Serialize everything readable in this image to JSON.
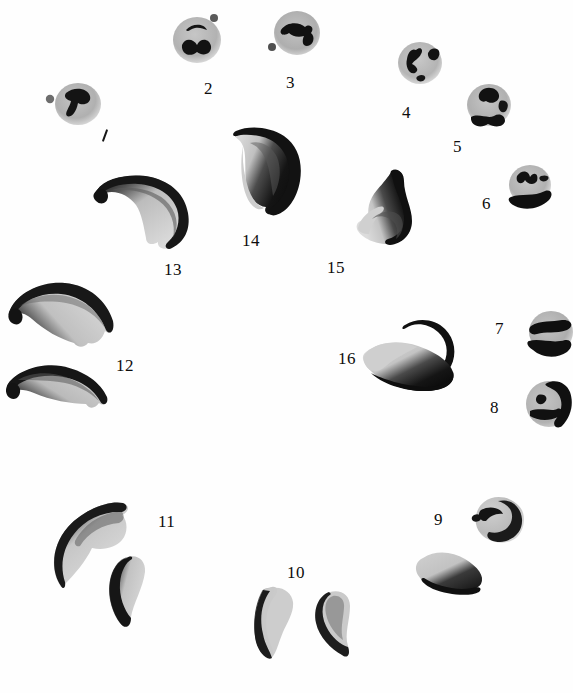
{
  "plate": {
    "kind": "microscopy-figure-plate",
    "background_color": "#fefefe",
    "ink_color": "#101010",
    "cytoplasm_color": "#b9b9b9",
    "width": 573,
    "height": 693,
    "caption": ""
  },
  "specimens": [
    {
      "id": 1,
      "label": "1",
      "label_style": "tick",
      "shape": "round-cell",
      "note": "rounded cell with dark hooked chromatin mass and small separate dot at left",
      "cx": 78,
      "cy": 104,
      "rx": 23,
      "ry": 21,
      "label_x": 99,
      "label_y": 130,
      "satellite": {
        "cx": 50,
        "cy": 99,
        "r": 4
      },
      "inclusions": [
        {
          "d": "M 66 93 C 74 86, 88 88, 90 96 C 92 104, 82 106, 78 103 C 76 114, 70 118, 67 116 C 64 113, 70 107, 71 101 C 67 100, 63 97, 66 93 Z"
        }
      ]
    },
    {
      "id": 2,
      "label": "2",
      "label_style": "numeral",
      "shape": "round-cell",
      "note": "rounded cell with crescent chromatin above and thick lobed mass below; small dot upper right",
      "cx": 197,
      "cy": 40,
      "rx": 24,
      "ry": 23,
      "label_x": 204,
      "label_y": 86,
      "satellite": {
        "cx": 213,
        "cy": 18,
        "r": 4
      },
      "inclusions": [
        {
          "d": "M 187 30 C 193 25, 203 25, 206 30 C 203 30, 200 28, 195 29 C 191 30, 189 33, 187 30 Z"
        },
        {
          "d": "M 182 44 C 186 38, 194 40, 196 45 C 199 39, 208 39, 210 46 C 211 53, 203 56, 197 52 C 191 57, 182 53, 182 44 Z"
        }
      ]
    },
    {
      "id": 3,
      "label": "3",
      "label_style": "numeral",
      "shape": "round-cell",
      "note": "rounded cell with broad angular chromatin band across upper half; dot at lower left",
      "cx": 297,
      "cy": 33,
      "rx": 23,
      "ry": 22,
      "label_x": 287,
      "label_y": 80,
      "satellite": {
        "cx": 272,
        "cy": 47,
        "r": 4
      },
      "inclusions": [
        {
          "d": "M 282 30 C 288 22, 300 23, 305 28 C 309 24, 314 28, 311 33 C 316 36, 314 45, 308 46 C 303 47, 302 40, 304 36 C 298 38, 292 36, 290 33 C 286 36, 280 35, 282 30 Z"
        }
      ]
    },
    {
      "id": 4,
      "label": "4",
      "label_style": "numeral",
      "shape": "round-cell",
      "note": "rounded cell with arrow-like chromatin left of centre and wedge at upper right",
      "cx": 420,
      "cy": 63,
      "rx": 22,
      "ry": 21,
      "label_x": 403,
      "label_y": 110,
      "inclusions": [
        {
          "d": "M 416 50 C 419 47, 423 49, 421 54 C 419 59, 414 60, 412 64 C 416 66, 419 70, 415 72 C 410 74, 406 66, 407 59 C 408 53, 412 49, 416 50 Z"
        },
        {
          "d": "M 430 50 C 436 47, 441 51, 438 57 C 435 62, 428 59, 428 54 Z"
        },
        {
          "d": "M 419 76 C 424 74, 427 78, 423 80 C 419 82, 416 78, 419 76 Z"
        }
      ]
    },
    {
      "id": 5,
      "label": "5",
      "label_style": "numeral",
      "shape": "round-cell",
      "note": "rounded cell with chromatin mass upper centre and dark band with hook along lower margin",
      "cx": 489,
      "cy": 105,
      "rx": 22,
      "ry": 21,
      "label_x": 455,
      "label_y": 144,
      "inclusions": [
        {
          "d": "M 481 92 C 487 87, 497 89, 498 95 C 499 101, 491 104, 486 101 C 481 103, 477 96, 481 92 Z"
        },
        {
          "d": "M 472 117 C 479 114, 487 119, 494 117 C 498 114, 504 115, 504 120 C 504 126, 496 127, 489 124 C 482 128, 472 125, 472 117 Z"
        },
        {
          "d": "M 500 102 C 506 100, 509 105, 506 110 C 502 113, 497 108, 500 102 Z"
        }
      ]
    },
    {
      "id": 6,
      "label": "6",
      "label_style": "numeral",
      "shape": "round-cell",
      "note": "rounded cell with jagged chromatin top, short dash right, and dark crescent band lower right",
      "cx": 530,
      "cy": 185,
      "rx": 21,
      "ry": 20,
      "label_x": 484,
      "label_y": 202,
      "inclusions": [
        {
          "d": "M 518 176 C 523 170, 529 172, 530 177 C 533 172, 538 174, 536 180 C 534 185, 527 184, 525 180 C 523 185, 516 182, 518 176 Z"
        },
        {
          "d": "M 541 176 C 547 175, 550 178, 546 180 C 542 182, 538 179, 541 176 Z"
        },
        {
          "d": "M 512 197 C 522 194, 534 197, 544 192 C 549 190, 552 194, 548 199 C 540 207, 526 210, 516 205 C 510 202, 508 198, 512 197 Z"
        }
      ]
    },
    {
      "id": 7,
      "label": "7",
      "label_style": "numeral",
      "shape": "round-cell-edge",
      "note": "rounded cell at right margin, partially cropped; dark chromatin band across middle and dark wedge below",
      "cx": 549,
      "cy": 333,
      "rx": 22,
      "ry": 21,
      "label_x": 497,
      "label_y": 328,
      "inclusions": [
        {
          "d": "M 532 327 C 540 321, 553 323, 562 321 C 570 320, 573 326, 566 330 C 556 334, 545 331, 537 334 C 531 335, 528 330, 532 327 Z"
        },
        {
          "d": "M 530 342 C 540 339, 553 344, 564 341 C 570 340, 572 346, 566 351 C 557 358, 543 357, 534 350 C 529 347, 527 343, 530 342 Z"
        }
      ]
    },
    {
      "id": 8,
      "label": "8",
      "label_style": "numeral",
      "shape": "round-cell-edge",
      "note": "rounded cell at right margin with dark rim on right side, small dot and bar chromatin inside",
      "cx": 549,
      "cy": 404,
      "rx": 23,
      "ry": 23,
      "label_x": 492,
      "label_y": 405,
      "inclusions": [
        {
          "d": "M 547 385 C 556 380, 566 384, 569 392 C 572 402, 570 416, 562 424 C 558 428, 553 424, 557 418 C 563 408, 562 396, 554 390 C 548 387, 544 387, 547 385 Z"
        },
        {
          "d": "M 538 396 C 545 394, 548 399, 544 403 C 539 406, 534 400, 538 396 Z"
        },
        {
          "d": "M 531 411 C 541 408, 552 412, 556 409 C 560 408, 562 413, 557 416 C 548 421, 537 419, 531 415 Z"
        }
      ]
    },
    {
      "id": 9,
      "label": "9",
      "label_style": "numeral",
      "shape": "round-cell-dark-half",
      "note": "cell with pale upper-left lobe and dark angular lower-right half; slit chromatin inside pale area",
      "cx": 495,
      "cy": 519,
      "rx": 23,
      "ry": 22,
      "label_x": 437,
      "label_y": 519,
      "inclusions": [
        {
          "d": "M 498 503 C 510 499, 520 507, 521 518 C 522 530, 513 540, 500 541 C 490 541, 484 536, 488 532 C 500 534, 510 528, 511 518 C 512 509, 505 504, 498 503 Z"
        },
        {
          "d": "M 481 511 C 490 506, 500 509, 502 514 C 496 513, 490 516, 486 520 C 482 521, 477 516, 481 511 Z"
        },
        {
          "d": "M 475 515 C 480 513, 483 518, 479 521 C 474 523, 471 517, 475 515 Z"
        }
      ]
    },
    {
      "id": 10,
      "label": "10",
      "label_style": "numeral",
      "shape": "crescent-pair",
      "note": "two small banana-shaped bodies, pale bodies with dark concave edges; plus one dark-half body at right",
      "label_x": 289,
      "label_y": 572
    },
    {
      "id": 11,
      "label": "11",
      "label_style": "numeral",
      "shape": "crescent-pair",
      "note": "large falciform body with dark convex edge above and smaller crescent below",
      "label_x": 160,
      "label_y": 521
    },
    {
      "id": 12,
      "label": "12",
      "label_style": "numeral",
      "shape": "crescent-pair",
      "note": "two broad arched bodies, dark along the convex upper edge with pale lower body",
      "label_x": 118,
      "label_y": 366
    },
    {
      "id": 13,
      "label": "13",
      "label_style": "numeral",
      "shape": "crescent",
      "note": "hook-shaped body, dark along the outer curve, pale interior",
      "label_x": 167,
      "label_y": 269
    },
    {
      "id": 14,
      "label": "14",
      "label_style": "numeral",
      "shape": "crescent",
      "note": "sickle body pointing down, dense dark right margin, pale left margin",
      "label_x": 244,
      "label_y": 240
    },
    {
      "id": 15,
      "label": "15",
      "label_style": "numeral",
      "shape": "crescent",
      "note": "sickle body with long tapering upper horn, dark along concave right edge",
      "label_x": 329,
      "label_y": 266
    },
    {
      "id": 16,
      "label": "16",
      "label_style": "numeral",
      "shape": "crescent",
      "note": "broad boat-shaped body with fine curved upper horn sweeping to the right",
      "label_x": 340,
      "label_y": 358
    }
  ]
}
